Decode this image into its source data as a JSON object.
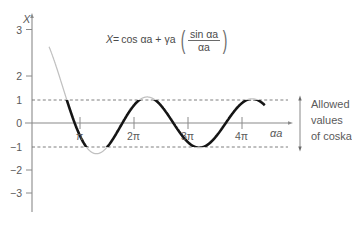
{
  "figure": {
    "title": "",
    "equation": {
      "lhs": "X",
      "eq_sign": "=",
      "term1": "cos αa",
      "plus": "+",
      "term2": "γa",
      "paren_open": "(",
      "numerator": "sin αa",
      "denominator": "αa",
      "paren_close": ")"
    },
    "y_axis": {
      "name": "X",
      "ticks": [
        {
          "value": 3,
          "label": "3"
        },
        {
          "value": 2,
          "label": "2"
        },
        {
          "value": 1,
          "label": "1"
        },
        {
          "value": 0,
          "label": "0"
        },
        {
          "value": -1,
          "label": "−1"
        },
        {
          "value": -2,
          "label": "−2"
        },
        {
          "value": -3,
          "label": "−3"
        }
      ]
    },
    "x_axis": {
      "name": "αa",
      "ticks": [
        {
          "value": 3.14159,
          "label": "π"
        },
        {
          "value": 6.28319,
          "label": "2π"
        },
        {
          "value": 9.42478,
          "label": "3π"
        },
        {
          "value": 12.56637,
          "label": "4π"
        }
      ]
    },
    "band_lines": {
      "upper_value": 1,
      "lower_value": -1
    },
    "annotation": {
      "line1": "Allowed",
      "line2": "values",
      "line3": "of coska"
    },
    "colors": {
      "allowed_curve": "#1a1a1a",
      "forbidden_curve": "#b8b8b8",
      "axis": "#8a8a8a",
      "dashed": "#707070",
      "text": "#555555"
    }
  },
  "chart_data": {
    "type": "line",
    "title": "",
    "xlabel": "αa",
    "ylabel": "X",
    "xlim": [
      0,
      14.2
    ],
    "ylim": [
      -3.6,
      3.6
    ],
    "grid": false,
    "legend": null,
    "function": "X = cos(αa) + γa * sin(αa)/(αa)",
    "gamma_a": 3.2,
    "xtick_values": [
      3.14159,
      6.28319,
      9.42478,
      12.56637
    ],
    "xtick_labels": [
      "π",
      "2π",
      "3π",
      "4π"
    ],
    "ytick_values": [
      3,
      2,
      1,
      0,
      -1,
      -2,
      -3
    ],
    "ytick_labels": [
      "3",
      "2",
      "1",
      "0",
      "-1",
      "-2",
      "-3"
    ],
    "hlines": [
      {
        "y": 1,
        "style": "dashed",
        "label": "upper band limit"
      },
      {
        "y": -1,
        "style": "dashed",
        "label": "lower band limit"
      }
    ],
    "series": [
      {
        "name": "allowed (|X| <= 1)",
        "style": "solid-thick-black",
        "description": "Portions of the curve lying between X = -1 and X = +1; these correspond to allowed energy bands."
      },
      {
        "name": "forbidden (|X| > 1)",
        "style": "solid-thin-gray",
        "description": "Portions of the curve lying outside X = -1 to X = +1; these correspond to forbidden energy gaps."
      }
    ],
    "annotations": [
      {
        "text": "Allowed values of coska",
        "position": "right",
        "y_range": [
          -1,
          1
        ],
        "arrow": "double-headed-vertical"
      },
      {
        "text": "X = cos αa + γa (sin αa / αa)",
        "position": "top-center"
      }
    ]
  }
}
